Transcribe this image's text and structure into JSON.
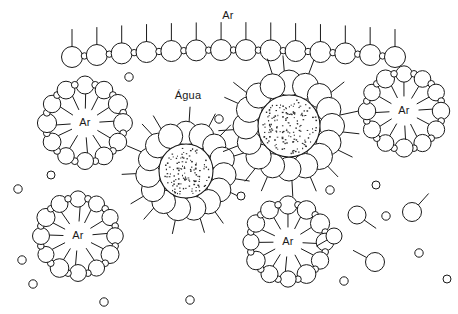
{
  "figure": {
    "width": 458,
    "height": 314,
    "background_color": "#ffffff",
    "line_color": "#1a1a1a"
  },
  "labels": {
    "air_top": "Ar",
    "water": "Água",
    "bubble_1": "Ar",
    "bubble_2": "Ar",
    "bubble_3": "Ar",
    "bubble_4": "Ar"
  },
  "label_positions": {
    "air_top": {
      "x": 228,
      "y": 16
    },
    "water": {
      "x": 188,
      "y": 96
    },
    "bubble_1": {
      "x": 85,
      "y": 123
    },
    "bubble_2": {
      "x": 404,
      "y": 111
    },
    "bubble_3": {
      "x": 78,
      "y": 236
    },
    "bubble_4": {
      "x": 288,
      "y": 242
    }
  },
  "monolayer": {
    "description": "Arched surfactant monolayer at the air-water interface",
    "unit_count": 14,
    "head_radius": 10.5,
    "linker_radius": 3.2,
    "tail_length": 17,
    "x_start": 72,
    "x_end": 395,
    "y_center": 50,
    "arch_rise": 7
  },
  "water_micelles": [
    {
      "name": "water-core-micelle-left",
      "cx": 186,
      "cy": 171,
      "core_radius": 27,
      "head_count": 15,
      "head_radius": 12,
      "ring_radius": 38,
      "tail_length": 17,
      "stipple_count": 120
    },
    {
      "name": "water-core-micelle-right",
      "cx": 289,
      "cy": 126,
      "core_radius": 31,
      "head_count": 16,
      "head_radius": 12.5,
      "ring_radius": 43,
      "tail_length": 18,
      "stipple_count": 150
    }
  ],
  "air_bubbles": [
    {
      "name": "air-bubble-micelle-top-left",
      "cx": 85,
      "cy": 123,
      "pair_count": 12,
      "ring_radius": 38,
      "head_radius": 9,
      "linker_radius": 3.4,
      "tail_length": 16
    },
    {
      "name": "air-bubble-micelle-top-right",
      "cx": 404,
      "cy": 111,
      "pair_count": 12,
      "ring_radius": 37,
      "head_radius": 8.8,
      "linker_radius": 3.3,
      "tail_length": 15
    },
    {
      "name": "air-bubble-micelle-bottom-left",
      "cx": 78,
      "cy": 236,
      "pair_count": 12,
      "ring_radius": 37,
      "head_radius": 8.8,
      "linker_radius": 3.3,
      "tail_length": 15
    },
    {
      "name": "air-bubble-micelle-bottom-center",
      "cx": 288,
      "cy": 242,
      "pair_count": 12,
      "ring_radius": 37,
      "head_radius": 8.8,
      "linker_radius": 3.3,
      "tail_length": 15
    }
  ],
  "free_monomers": [
    {
      "cx": 357,
      "cy": 215,
      "r": 9,
      "tail_angle": 35,
      "tail_len": 14
    },
    {
      "cx": 412,
      "cy": 212,
      "r": 9.5,
      "tail_angle": -48,
      "tail_len": 15
    },
    {
      "cx": 375,
      "cy": 262,
      "r": 9.5,
      "tail_angle": 208,
      "tail_len": 15
    },
    {
      "cx": 334,
      "cy": 236,
      "r": 8,
      "tail_angle": 150,
      "tail_len": 12
    }
  ],
  "free_small_circles": [
    {
      "cx": 129,
      "cy": 77,
      "r": 4.2
    },
    {
      "cx": 219,
      "cy": 119,
      "r": 4.2
    },
    {
      "cx": 18,
      "cy": 189,
      "r": 4.2
    },
    {
      "cx": 51,
      "cy": 175,
      "r": 4.0
    },
    {
      "cx": 22,
      "cy": 260,
      "r": 4.2
    },
    {
      "cx": 33,
      "cy": 284,
      "r": 4.2
    },
    {
      "cx": 104,
      "cy": 302,
      "r": 4.2
    },
    {
      "cx": 190,
      "cy": 300,
      "r": 4.2
    },
    {
      "cx": 330,
      "cy": 190,
      "r": 4.2
    },
    {
      "cx": 376,
      "cy": 185,
      "r": 4.0
    },
    {
      "cx": 386,
      "cy": 216,
      "r": 4.2
    },
    {
      "cx": 419,
      "cy": 253,
      "r": 4.2
    },
    {
      "cx": 344,
      "cy": 281,
      "r": 4.2
    },
    {
      "cx": 447,
      "cy": 279,
      "r": 4.0
    },
    {
      "cx": 241,
      "cy": 196,
      "r": 4.0
    }
  ]
}
